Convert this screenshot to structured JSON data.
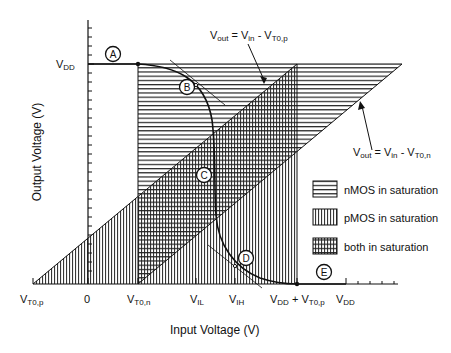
{
  "figure": {
    "xlabel": "Input Voltage  (V)",
    "ylabel": "Output Voltage  (V)",
    "y_ticks": [
      {
        "main": "V",
        "sub": "DD"
      }
    ],
    "x_ticks": [
      {
        "main": "V",
        "sub": "T0,p"
      },
      {
        "main": "0",
        "sub": ""
      },
      {
        "main": "V",
        "sub": "T0,n"
      },
      {
        "main": "V",
        "sub": "IL"
      },
      {
        "main": "V",
        "sub": "IH"
      },
      {
        "main": "V",
        "sub": "DD",
        "suffix": " + V",
        "suffix_sub": "T0,p"
      },
      {
        "main": "V",
        "sub": "DD"
      }
    ],
    "annotations": {
      "line_p": {
        "a": "V",
        "a_sub": "out",
        "eq": " = V",
        "b_sub": "in",
        "c": " - V",
        "c_sub": "T0,p"
      },
      "line_n": {
        "a": "V",
        "a_sub": "out",
        "eq": " = V",
        "b_sub": "in",
        "c": " - V",
        "c_sub": "T0,n"
      }
    },
    "points": [
      "A",
      "B",
      "C",
      "D",
      "E"
    ],
    "legend": [
      {
        "label": "nMOS in saturation",
        "pattern": "horizontal"
      },
      {
        "label": "pMOS in saturation",
        "pattern": "vertical"
      },
      {
        "label": "both in saturation",
        "pattern": "crosshatch"
      }
    ]
  }
}
